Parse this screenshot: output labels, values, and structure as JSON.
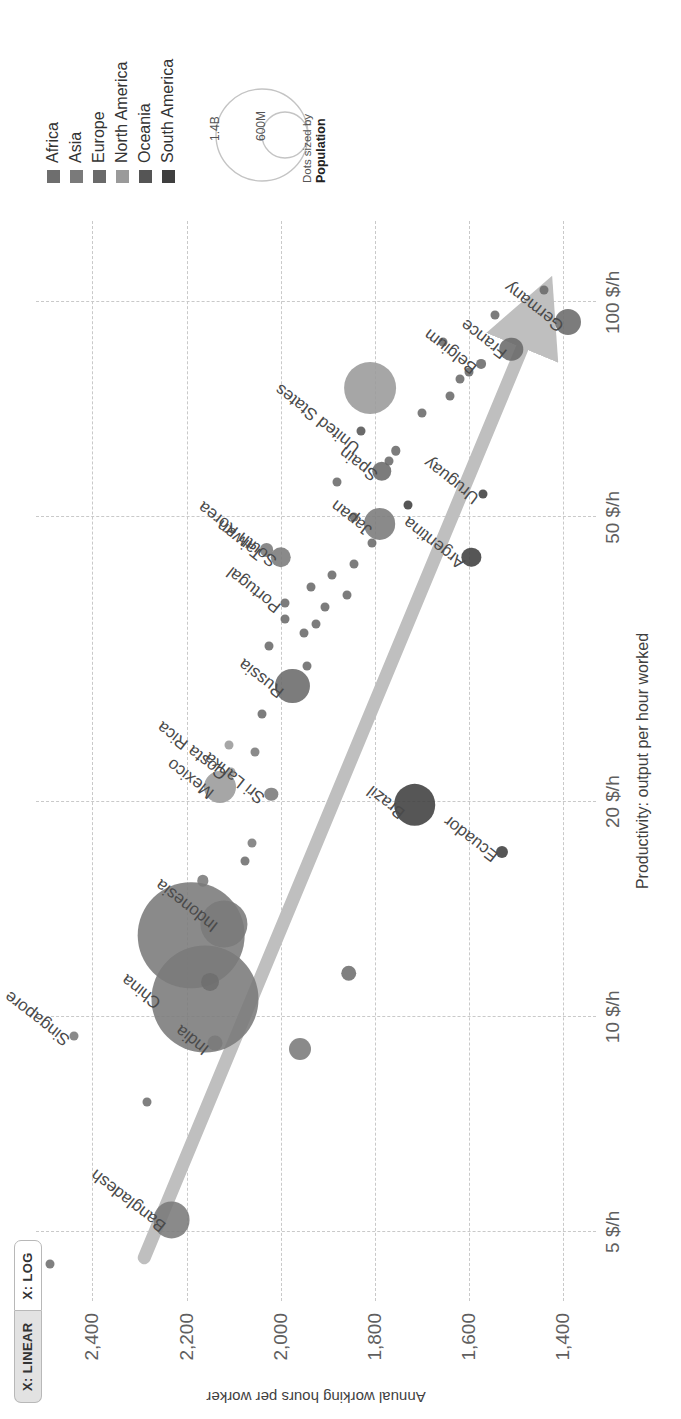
{
  "controls": {
    "linear_label": "X: LINEAR",
    "log_label": "X: LOG",
    "selected": "X: LOG"
  },
  "legend": {
    "items": [
      {
        "label": "Africa",
        "color": "#6e6e6e"
      },
      {
        "label": "Asia",
        "color": "#7a7a7a"
      },
      {
        "label": "Europe",
        "color": "#6a6a6a"
      },
      {
        "label": "North America",
        "color": "#9a9a9a"
      },
      {
        "label": "Oceania",
        "color": "#555555"
      },
      {
        "label": "South America",
        "color": "#3f3f3f"
      }
    ],
    "size_big_label": "1.4B",
    "size_small_label": "600M",
    "size_note_line1": "Dots sized by",
    "size_note_line2": "Population"
  },
  "chart_data": {
    "type": "scatter",
    "title": "",
    "xlabel": "Productivity: output per hour worked",
    "ylabel": "Annual working hours per worker",
    "xscale": "log",
    "xlim": [
      4.0,
      130
    ],
    "ylim": [
      1330,
      2520
    ],
    "grid": true,
    "xticks": [
      5,
      10,
      20,
      50,
      100
    ],
    "xticklabels": [
      "5 $/h",
      "10 $/h",
      "20 $/h",
      "50 $/h",
      "100 $/h"
    ],
    "yticks": [
      1400,
      1600,
      1800,
      2000,
      2200,
      2400
    ],
    "yticklabels": [
      "1,400",
      "1,600",
      "1,800",
      "2,000",
      "2,200",
      "2,400"
    ],
    "legend_position": "right",
    "size_encoding": "population",
    "annotation": "trend arrow rising from low productivity / high hours to high productivity / low hours",
    "points": [
      {
        "name": "Bangladesh",
        "x": 5.2,
        "y": 2232,
        "pop": 169,
        "continent": "Asia",
        "label": true,
        "lx": -8,
        "ly": -18,
        "rot": -52
      },
      {
        "name": "Singapore",
        "x": 9.4,
        "y": 2440,
        "pop": 6,
        "continent": "Asia",
        "label": true,
        "lx": -6,
        "ly": -16,
        "rot": -52
      },
      {
        "name": "India",
        "x": 10.6,
        "y": 2160,
        "pop": 1420,
        "continent": "Asia",
        "label": true,
        "lx": -52,
        "ly": -8,
        "rot": -52
      },
      {
        "name": "China",
        "x": 13.0,
        "y": 2190,
        "pop": 1410,
        "continent": "Asia",
        "label": true,
        "lx": -70,
        "ly": -42,
        "rot": -52
      },
      {
        "name": "Indonesia",
        "x": 13.5,
        "y": 2120,
        "pop": 275,
        "continent": "Asia",
        "label": true,
        "lx": -4,
        "ly": -18,
        "rot": -52
      },
      {
        "name": "Sri Lanka",
        "x": 20.5,
        "y": 2020,
        "pop": 22,
        "continent": "Asia",
        "label": true,
        "lx": -6,
        "ly": -18,
        "rot": -52
      },
      {
        "name": "Mexico",
        "x": 21.0,
        "y": 2130,
        "pop": 127,
        "continent": "North America",
        "label": true,
        "lx": -8,
        "ly": -18,
        "rot": -52
      },
      {
        "name": "Costa Rica",
        "x": 22.0,
        "y": 2105,
        "pop": 5,
        "continent": "North America",
        "label": true,
        "lx": -4,
        "ly": -16,
        "rot": -52
      },
      {
        "name": "Brazil",
        "x": 19.8,
        "y": 1715,
        "pop": 215,
        "continent": "South America",
        "label": true,
        "lx": -10,
        "ly": -22,
        "rot": -52
      },
      {
        "name": "Ecuador",
        "x": 17.0,
        "y": 1530,
        "pop": 18,
        "continent": "South America",
        "label": true,
        "lx": -6,
        "ly": -16,
        "rot": -52
      },
      {
        "name": "Russia",
        "x": 29.0,
        "y": 1975,
        "pop": 144,
        "continent": "Europe",
        "label": true,
        "lx": -8,
        "ly": -20,
        "rot": -52
      },
      {
        "name": "Portugal",
        "x": 38.0,
        "y": 1990,
        "pop": 10,
        "continent": "Europe",
        "label": true,
        "lx": -6,
        "ly": -16,
        "rot": -52
      },
      {
        "name": "South Korea",
        "x": 44.0,
        "y": 2000,
        "pop": 52,
        "continent": "Asia",
        "label": true,
        "lx": -6,
        "ly": -16,
        "rot": -52
      },
      {
        "name": "Taiwan",
        "x": 45.0,
        "y": 2030,
        "pop": 24,
        "continent": "Asia",
        "label": true,
        "lx": -6,
        "ly": -16,
        "rot": -52
      },
      {
        "name": "Argentina",
        "x": 44.0,
        "y": 1595,
        "pop": 46,
        "continent": "South America",
        "label": true,
        "lx": -8,
        "ly": -18,
        "rot": -52
      },
      {
        "name": "Uruguay",
        "x": 54.0,
        "y": 1570,
        "pop": 3,
        "continent": "South America",
        "label": true,
        "lx": -6,
        "ly": -16,
        "rot": -52
      },
      {
        "name": "Japan",
        "x": 49.0,
        "y": 1790,
        "pop": 125,
        "continent": "Asia",
        "label": true,
        "lx": -8,
        "ly": -20,
        "rot": -52
      },
      {
        "name": "Spain",
        "x": 58.0,
        "y": 1785,
        "pop": 47,
        "continent": "Europe",
        "label": true,
        "lx": -6,
        "ly": -16,
        "rot": -52
      },
      {
        "name": "United States",
        "x": 76.0,
        "y": 1810,
        "pop": 333,
        "continent": "North America",
        "label": true,
        "lx": -62,
        "ly": -22,
        "rot": -52
      },
      {
        "name": "Belgium",
        "x": 82.0,
        "y": 1575,
        "pop": 12,
        "continent": "Europe",
        "label": true,
        "lx": -6,
        "ly": -16,
        "rot": -52
      },
      {
        "name": "France",
        "x": 86.0,
        "y": 1510,
        "pop": 68,
        "continent": "Europe",
        "label": true,
        "lx": -6,
        "ly": -16,
        "rot": -52
      },
      {
        "name": "Germany",
        "x": 94.0,
        "y": 1390,
        "pop": 84,
        "continent": "Europe",
        "label": true,
        "lx": -6,
        "ly": -16,
        "rot": -52
      },
      {
        "name": "",
        "x": 4.5,
        "y": 2490,
        "pop": 3,
        "continent": "Africa",
        "label": false
      },
      {
        "name": "",
        "x": 7.6,
        "y": 2285,
        "pop": 5,
        "continent": "Africa",
        "label": false
      },
      {
        "name": "",
        "x": 9.2,
        "y": 2140,
        "pop": 28,
        "continent": "Asia",
        "label": false
      },
      {
        "name": "",
        "x": 11.2,
        "y": 2150,
        "pop": 40,
        "continent": "Africa",
        "label": false
      },
      {
        "name": "",
        "x": 9.0,
        "y": 1960,
        "pop": 60,
        "continent": "Asia",
        "label": false
      },
      {
        "name": "",
        "x": 11.5,
        "y": 1855,
        "pop": 30,
        "continent": "Africa",
        "label": false
      },
      {
        "name": "",
        "x": 15.5,
        "y": 2165,
        "pop": 16,
        "continent": "Asia",
        "label": false
      },
      {
        "name": "",
        "x": 16.5,
        "y": 2075,
        "pop": 8,
        "continent": "Africa",
        "label": false
      },
      {
        "name": "",
        "x": 17.5,
        "y": 2060,
        "pop": 6,
        "continent": "Asia",
        "label": false
      },
      {
        "name": "",
        "x": 23.5,
        "y": 2055,
        "pop": 5,
        "continent": "Asia",
        "label": false
      },
      {
        "name": "",
        "x": 24.0,
        "y": 2110,
        "pop": 5,
        "continent": "North America",
        "label": false
      },
      {
        "name": "",
        "x": 26.5,
        "y": 2040,
        "pop": 4,
        "continent": "Europe",
        "label": false
      },
      {
        "name": "",
        "x": 31.0,
        "y": 1945,
        "pop": 5,
        "continent": "Europe",
        "label": false
      },
      {
        "name": "",
        "x": 33.0,
        "y": 2025,
        "pop": 4,
        "continent": "Europe",
        "label": false
      },
      {
        "name": "",
        "x": 34.5,
        "y": 1950,
        "pop": 4,
        "continent": "Europe",
        "label": false
      },
      {
        "name": "",
        "x": 35.5,
        "y": 1925,
        "pop": 5,
        "continent": "Europe",
        "label": false
      },
      {
        "name": "",
        "x": 36.0,
        "y": 1990,
        "pop": 4,
        "continent": "Europe",
        "label": false
      },
      {
        "name": "",
        "x": 37.5,
        "y": 1905,
        "pop": 5,
        "continent": "Europe",
        "label": false
      },
      {
        "name": "",
        "x": 39.0,
        "y": 1860,
        "pop": 4,
        "continent": "Europe",
        "label": false
      },
      {
        "name": "",
        "x": 40.0,
        "y": 1935,
        "pop": 4,
        "continent": "Europe",
        "label": false
      },
      {
        "name": "",
        "x": 41.5,
        "y": 1890,
        "pop": 4,
        "continent": "Europe",
        "label": false
      },
      {
        "name": "",
        "x": 43.0,
        "y": 1845,
        "pop": 4,
        "continent": "Europe",
        "label": false
      },
      {
        "name": "",
        "x": 46.0,
        "y": 1805,
        "pop": 4,
        "continent": "Europe",
        "label": false
      },
      {
        "name": "",
        "x": 50.0,
        "y": 1845,
        "pop": 4,
        "continent": "Europe",
        "label": false
      },
      {
        "name": "",
        "x": 52.0,
        "y": 1730,
        "pop": 4,
        "continent": "South America",
        "label": false
      },
      {
        "name": "",
        "x": 56.0,
        "y": 1880,
        "pop": 4,
        "continent": "Europe",
        "label": false
      },
      {
        "name": "",
        "x": 60.0,
        "y": 1770,
        "pop": 9,
        "continent": "Europe",
        "label": false
      },
      {
        "name": "",
        "x": 62.0,
        "y": 1755,
        "pop": 11,
        "continent": "Europe",
        "label": false
      },
      {
        "name": "",
        "x": 66.0,
        "y": 1830,
        "pop": 5,
        "continent": "Oceania",
        "label": false
      },
      {
        "name": "",
        "x": 70.0,
        "y": 1700,
        "pop": 5,
        "continent": "Europe",
        "label": false
      },
      {
        "name": "",
        "x": 74.0,
        "y": 1640,
        "pop": 5,
        "continent": "Europe",
        "label": false
      },
      {
        "name": "",
        "x": 78.0,
        "y": 1620,
        "pop": 6,
        "continent": "Europe",
        "label": false
      },
      {
        "name": "",
        "x": 80.0,
        "y": 1600,
        "pop": 5,
        "continent": "Europe",
        "label": false
      },
      {
        "name": "",
        "x": 88.0,
        "y": 1655,
        "pop": 4,
        "continent": "Europe",
        "label": false
      },
      {
        "name": "",
        "x": 96.0,
        "y": 1545,
        "pop": 4,
        "continent": "Europe",
        "label": false
      },
      {
        "name": "",
        "x": 104.0,
        "y": 1440,
        "pop": 4,
        "continent": "Europe",
        "label": false
      }
    ]
  }
}
